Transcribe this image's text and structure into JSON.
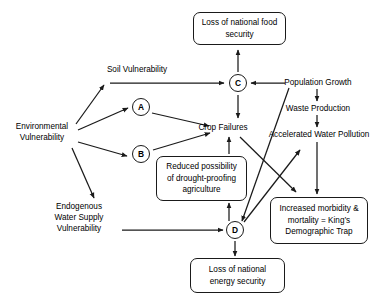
{
  "diagram": {
    "stroke_color": "#1a1a1a",
    "background_color": "#ffffff",
    "nodes": {
      "environmental_vulnerability": {
        "line1": "Environmental",
        "line2": "Vulnerability"
      },
      "soil_vulnerability": {
        "label": "Soil Vulnerability"
      },
      "endogenous_water_supply": {
        "line1": "Endogenous",
        "line2": "Water Supply",
        "line3": "Vulnerability"
      },
      "node_a": {
        "label": "A"
      },
      "node_b": {
        "label": "B"
      },
      "node_c": {
        "label": "C"
      },
      "node_d": {
        "label": "D"
      },
      "crop_failures": {
        "label": "Crop Failures"
      },
      "population_growth": {
        "label": "Population Growth"
      },
      "waste_production": {
        "label": "Waste Production"
      },
      "accelerated_water_pollution": {
        "label": "Accelerated Water Pollution"
      },
      "loss_food_security": {
        "line1": "Loss of national food",
        "line2": "security"
      },
      "loss_energy_security": {
        "line1": "Loss of national",
        "line2": "energy security"
      },
      "reduced_drought_proofing": {
        "line1": "Reduced possibility",
        "line2": "of drought-proofing",
        "line3": "agriculture"
      },
      "increased_morbidity": {
        "line1": "Increased morbidity &",
        "line2": "mortality = King’s",
        "line3": "Demographic Trap"
      }
    },
    "edges": [
      {
        "from": "environmental_vulnerability",
        "to": "soil_vulnerability"
      },
      {
        "from": "environmental_vulnerability",
        "to": "node_a"
      },
      {
        "from": "environmental_vulnerability",
        "to": "node_b"
      },
      {
        "from": "environmental_vulnerability",
        "to": "endogenous_water_supply"
      },
      {
        "from": "soil_vulnerability",
        "to": "node_c"
      },
      {
        "from": "node_a",
        "to": "crop_failures"
      },
      {
        "from": "node_b",
        "to": "crop_failures"
      },
      {
        "from": "node_c",
        "to": "loss_food_security"
      },
      {
        "from": "node_c",
        "to": "crop_failures"
      },
      {
        "from": "population_growth",
        "to": "node_c"
      },
      {
        "from": "population_growth",
        "to": "waste_production"
      },
      {
        "from": "waste_production",
        "to": "accelerated_water_pollution"
      },
      {
        "from": "accelerated_water_pollution",
        "to": "increased_morbidity"
      },
      {
        "from": "crop_failures",
        "to": "increased_morbidity"
      },
      {
        "from": "reduced_drought_proofing",
        "to": "crop_failures"
      },
      {
        "from": "node_d",
        "to": "reduced_drought_proofing"
      },
      {
        "from": "node_d",
        "to": "accelerated_water_pollution"
      },
      {
        "from": "node_d",
        "to": "loss_energy_security"
      },
      {
        "from": "endogenous_water_supply",
        "to": "node_d"
      },
      {
        "from": "population_growth_line",
        "to": "node_d"
      }
    ]
  }
}
